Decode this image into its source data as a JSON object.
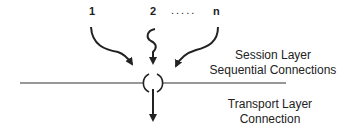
{
  "diagram": {
    "inputs": [
      {
        "label": "1"
      },
      {
        "label": "2"
      },
      {
        "label": "....."
      },
      {
        "label": "n"
      }
    ],
    "session_label": {
      "line1": "Session Layer",
      "line2": "Sequential Connections"
    },
    "transport_label": {
      "line1": "Transport Layer",
      "line2": "Connection"
    },
    "colors": {
      "stroke": "#222222",
      "background": "#ffffff"
    }
  }
}
